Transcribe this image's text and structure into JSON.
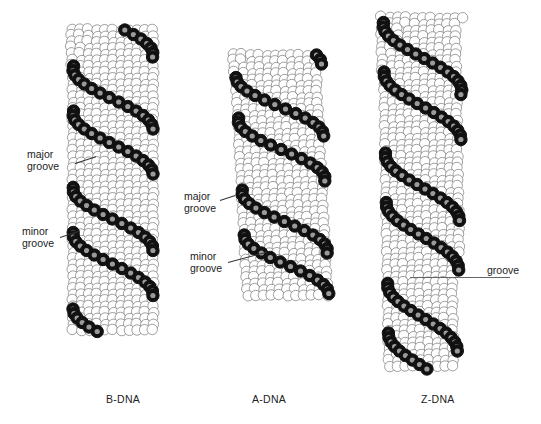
{
  "figure": {
    "panels": [
      {
        "id": "b-dna",
        "caption": "B-DNA",
        "annotations": [
          {
            "line1": "major",
            "line2": "groove"
          },
          {
            "line1": "minor",
            "line2": "groove"
          }
        ]
      },
      {
        "id": "a-dna",
        "caption": "A-DNA",
        "annotations": [
          {
            "line1": "major",
            "line2": "groove"
          },
          {
            "line1": "minor",
            "line2": "groove"
          }
        ]
      },
      {
        "id": "z-dna",
        "caption": "Z-DNA",
        "annotations": [
          {
            "line1": "groove",
            "line2": ""
          }
        ]
      }
    ],
    "colors": {
      "backbone": "#111111",
      "backbone_center": "#9a9a9a",
      "bases": "#ffffff",
      "outline": "#333333",
      "background": "#ffffff"
    }
  }
}
